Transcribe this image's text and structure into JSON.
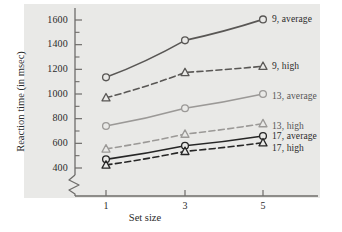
{
  "chart_data": {
    "type": "line",
    "title": "",
    "xlabel": "Set size",
    "ylabel": "Reaction time (in msec)",
    "x": [
      1,
      3,
      5
    ],
    "xtick_labels": [
      "1",
      "3",
      "5"
    ],
    "ytick_labels": [
      "400",
      "600",
      "800",
      "1000",
      "1200",
      "1400",
      "1600"
    ],
    "ytick_values": [
      400,
      600,
      800,
      1000,
      1200,
      1400,
      1600
    ],
    "ylim": [
      380,
      1660
    ],
    "xlim": [
      0.5,
      5.7
    ],
    "y_axis_break": true,
    "grid": false,
    "legend_position": "right-inline",
    "series": [
      {
        "name": "9, average",
        "label": "9, average",
        "values": [
          1135,
          1435,
          1605
        ],
        "marker": "circle",
        "line_style": "solid",
        "color": "#595755"
      },
      {
        "name": "9, high",
        "label": "9, high",
        "values": [
          970,
          1175,
          1225
        ],
        "marker": "triangle",
        "line_style": "dashed",
        "color": "#595755"
      },
      {
        "name": "13, average",
        "label": "13, average",
        "values": [
          740,
          885,
          1000
        ],
        "marker": "circle",
        "line_style": "solid",
        "color": "#9b9997"
      },
      {
        "name": "13, high",
        "label": "13, high",
        "values": [
          555,
          675,
          760
        ],
        "marker": "triangle",
        "line_style": "dashed",
        "color": "#9b9997"
      },
      {
        "name": "17, average",
        "label": "17, average",
        "values": [
          470,
          580,
          660
        ],
        "marker": "circle",
        "line_style": "solid",
        "color": "#262626"
      },
      {
        "name": "17, high",
        "label": "17, high",
        "values": [
          425,
          535,
          605
        ],
        "marker": "triangle",
        "line_style": "dashed",
        "color": "#262626"
      }
    ]
  },
  "colors": {
    "panel_background": "#e9e9e7",
    "page_background": "#ffffff",
    "axis": "#6e6c6a",
    "text": "#2b2b2b"
  }
}
